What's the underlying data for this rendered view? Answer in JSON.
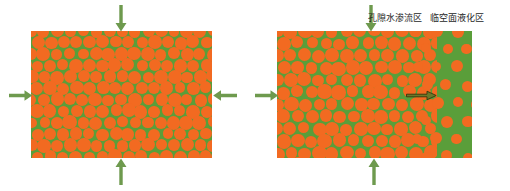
{
  "figure": {
    "background_color": "#ffffff",
    "width": 510,
    "height": 191
  },
  "colors": {
    "particle": "#f26a21",
    "matrix": "#5a9e3a",
    "arrow": "#6e9a4e",
    "inner_arrow_outline": "#4d5a1e",
    "label_text": "#262626"
  },
  "panels": [
    {
      "id": "left-panel",
      "name": "initial-state-panel",
      "x": 31,
      "y": 31,
      "width": 181,
      "height": 127,
      "zones": [
        {
          "id": "dense-zone",
          "label": "",
          "x": 0,
          "width": 181,
          "packing": "dense"
        }
      ],
      "arrows": [
        {
          "id": "top-arrow",
          "direction": "down",
          "x": 121,
          "y": 6,
          "length": 24
        },
        {
          "id": "bottom-arrow",
          "direction": "up",
          "x": 121,
          "y": 158,
          "length": 25
        },
        {
          "id": "left-arrow",
          "direction": "right",
          "y": 95,
          "x": 10,
          "length": 21
        },
        {
          "id": "right-arrow",
          "direction": "left",
          "y": 95,
          "x": 212,
          "length": 24
        }
      ]
    },
    {
      "id": "right-panel",
      "name": "liquefaction-state-panel",
      "x": 277,
      "y": 31,
      "width": 195,
      "height": 127,
      "zones": [
        {
          "id": "seepage-zone",
          "label": "孔隙水渗流区",
          "x": 0,
          "width": 160,
          "packing": "dense"
        },
        {
          "id": "liquefaction-zone",
          "label": "临空面液化区",
          "x": 160,
          "width": 35,
          "packing": "sparse"
        }
      ],
      "arrows": [
        {
          "id": "top-arrow",
          "direction": "down",
          "x": 371,
          "y": 6,
          "length": 24
        },
        {
          "id": "bottom-arrow",
          "direction": "up",
          "x": 374,
          "y": 158,
          "length": 25
        },
        {
          "id": "left-arrow",
          "direction": "right",
          "y": 95,
          "x": 256,
          "length": 21
        }
      ],
      "inner_arrow": {
        "id": "seepage-flow-arrow",
        "direction": "right",
        "x": 407,
        "y": 95,
        "length": 29,
        "style": "outlined"
      }
    }
  ],
  "labels": [
    {
      "id": "label-seepage-zone",
      "name": "seepage-zone-label",
      "text": "孔隙水渗流区",
      "x": 368,
      "y": 13
    },
    {
      "id": "label-liquefaction-zone",
      "name": "liquefaction-zone-label",
      "text": "临空面液化区",
      "x": 430,
      "y": 13
    }
  ]
}
